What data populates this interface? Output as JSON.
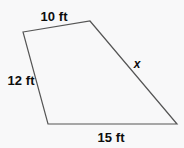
{
  "figure": {
    "type": "quadrilateral",
    "background_color": "#f8f8f9",
    "stroke_color": "#555555",
    "stroke_width": 1.2,
    "label_color": "#0d0d0d",
    "vertices": [
      {
        "name": "top-left",
        "x": 23,
        "y": 32
      },
      {
        "name": "top-right",
        "x": 90,
        "y": 21
      },
      {
        "name": "bottom-right",
        "x": 177,
        "y": 124
      },
      {
        "name": "bottom-left",
        "x": 48,
        "y": 124
      }
    ],
    "polygon_points": "23,32 90,21 177,124 48,124",
    "sides": [
      {
        "id": "top",
        "label": "10 ft",
        "from": "top-left",
        "to": "top-right",
        "label_x": 54,
        "label_y": 16
      },
      {
        "id": "left",
        "label": "12 ft",
        "from": "top-left",
        "to": "bottom-left",
        "label_x": 21,
        "label_y": 80
      },
      {
        "id": "bottom",
        "label": "15 ft",
        "from": "bottom-left",
        "to": "bottom-right",
        "label_x": 111,
        "label_y": 137
      },
      {
        "id": "slant",
        "label": "x",
        "from": "top-right",
        "to": "bottom-right",
        "label_x": 137,
        "label_y": 64
      }
    ]
  }
}
